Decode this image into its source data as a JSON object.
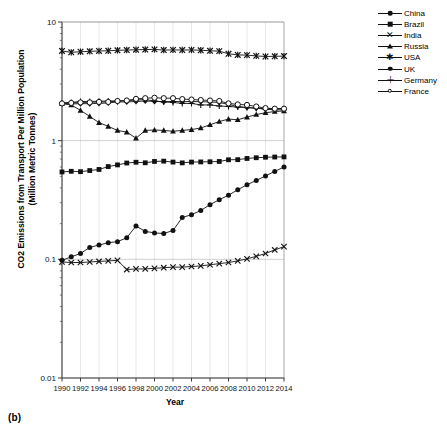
{
  "figure": {
    "panel_label": "(b)",
    "xlabel": "Year",
    "ylabel_line1": "CO2 Emissions from Transport Per Million Population",
    "ylabel_line2": "(Million Metric Tonnes)"
  },
  "legend": {
    "position": "right",
    "items": [
      {
        "label": "China",
        "marker": "filled-circle",
        "color": "#111111"
      },
      {
        "label": "Brazil",
        "marker": "filled-square",
        "color": "#111111"
      },
      {
        "label": "India",
        "marker": "x",
        "color": "#111111"
      },
      {
        "label": "Russia",
        "marker": "filled-triangle",
        "color": "#111111"
      },
      {
        "label": "USA",
        "marker": "asterisk",
        "color": "#111111"
      },
      {
        "label": "UK",
        "marker": "filled-diamond",
        "color": "#111111"
      },
      {
        "label": "Germany",
        "marker": "plus",
        "color": "#111111"
      },
      {
        "label": "France",
        "marker": "open-circle",
        "color": "#111111"
      }
    ]
  },
  "axes": {
    "y_ticks": [
      "10",
      "1",
      "0.1",
      "0.01"
    ],
    "y_tick_values": [
      10,
      1,
      0.1,
      0.01
    ],
    "y_scale": "log",
    "x_ticks": [
      "1990",
      "1992",
      "1994",
      "1996",
      "1998",
      "2000",
      "2002",
      "2004",
      "2006",
      "2008",
      "2010",
      "2012",
      "2014"
    ],
    "grid": "vertical-and-horizontal-major"
  },
  "chart_data": {
    "type": "line",
    "title": "",
    "xlabel": "Year",
    "ylabel": "CO2 Emissions from Transport Per Million Population (Million Metric Tonnes)",
    "yscale": "log",
    "ylim": [
      0.01,
      10
    ],
    "xlim": [
      1990,
      2014
    ],
    "grid": true,
    "legend_position": "right",
    "x": [
      1990,
      1991,
      1992,
      1993,
      1994,
      1995,
      1996,
      1997,
      1998,
      1999,
      2000,
      2001,
      2002,
      2003,
      2004,
      2005,
      2006,
      2007,
      2008,
      2009,
      2010,
      2011,
      2012,
      2013,
      2014
    ],
    "series": [
      {
        "name": "China",
        "marker": "filled-circle",
        "values": [
          0.098,
          0.105,
          0.112,
          0.126,
          0.132,
          0.138,
          0.141,
          0.152,
          0.191,
          0.172,
          0.167,
          0.165,
          0.175,
          0.225,
          0.238,
          0.258,
          0.289,
          0.318,
          0.347,
          0.386,
          0.425,
          0.462,
          0.505,
          0.551,
          0.6
        ]
      },
      {
        "name": "Brazil",
        "marker": "filled-square",
        "values": [
          0.545,
          0.552,
          0.548,
          0.56,
          0.572,
          0.605,
          0.625,
          0.648,
          0.658,
          0.651,
          0.668,
          0.672,
          0.66,
          0.65,
          0.66,
          0.662,
          0.664,
          0.668,
          0.69,
          0.692,
          0.708,
          0.718,
          0.725,
          0.728,
          0.73
        ]
      },
      {
        "name": "India",
        "marker": "x",
        "values": [
          0.095,
          0.094,
          0.094,
          0.095,
          0.096,
          0.097,
          0.098,
          0.082,
          0.083,
          0.083,
          0.084,
          0.085,
          0.086,
          0.086,
          0.087,
          0.088,
          0.09,
          0.092,
          0.094,
          0.097,
          0.101,
          0.106,
          0.112,
          0.12,
          0.128
        ]
      },
      {
        "name": "Russia",
        "marker": "filled-triangle",
        "values": [
          2.05,
          2.0,
          1.8,
          1.6,
          1.42,
          1.32,
          1.22,
          1.18,
          1.05,
          1.22,
          1.23,
          1.22,
          1.2,
          1.22,
          1.24,
          1.28,
          1.36,
          1.45,
          1.52,
          1.5,
          1.58,
          1.66,
          1.72,
          1.76,
          1.78
        ]
      },
      {
        "name": "USA",
        "marker": "asterisk",
        "values": [
          5.7,
          5.55,
          5.62,
          5.66,
          5.7,
          5.72,
          5.78,
          5.8,
          5.84,
          5.86,
          5.88,
          5.8,
          5.82,
          5.8,
          5.82,
          5.78,
          5.72,
          5.68,
          5.4,
          5.28,
          5.26,
          5.18,
          5.12,
          5.14,
          5.16
        ]
      },
      {
        "name": "UK",
        "marker": "filled-diamond",
        "values": [
          2.06,
          2.04,
          2.05,
          2.05,
          2.06,
          2.08,
          2.12,
          2.12,
          2.14,
          2.16,
          2.14,
          2.13,
          2.14,
          2.13,
          2.14,
          2.13,
          2.12,
          2.1,
          2.02,
          1.94,
          1.9,
          1.88,
          1.86,
          1.86,
          1.87
        ]
      },
      {
        "name": "Germany",
        "marker": "plus",
        "values": [
          2.08,
          2.1,
          2.14,
          2.14,
          2.15,
          2.16,
          2.16,
          2.17,
          2.2,
          2.22,
          2.16,
          2.12,
          2.1,
          2.06,
          2.06,
          2.0,
          2.0,
          1.96,
          1.94,
          1.92,
          1.9,
          1.88,
          1.84,
          1.82,
          1.82
        ]
      },
      {
        "name": "France",
        "marker": "open-circle",
        "values": [
          2.06,
          2.08,
          2.1,
          2.1,
          2.12,
          2.12,
          2.16,
          2.18,
          2.25,
          2.28,
          2.3,
          2.28,
          2.28,
          2.24,
          2.22,
          2.2,
          2.18,
          2.16,
          2.06,
          2.02,
          2.0,
          1.94,
          1.88,
          1.86,
          1.86
        ]
      }
    ]
  }
}
